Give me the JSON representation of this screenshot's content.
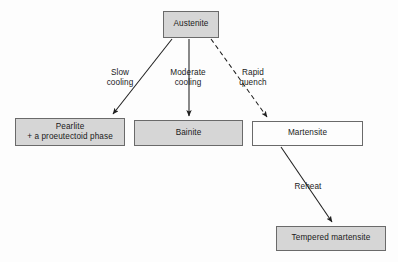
{
  "diagram": {
    "colors": {
      "node_fill_shaded": "#d6d6d6",
      "node_fill_plain": "#fdfdfd",
      "node_stroke": "#6a6a6a",
      "edge_stroke": "#1f1f1f",
      "text": "#1a1a1a",
      "background": "#fdfdfd"
    },
    "nodes": [
      {
        "id": "austenite",
        "lines": [
          "Austenite"
        ],
        "fill": "shaded"
      },
      {
        "id": "pearlite",
        "lines": [
          "Pearlite",
          "+ a proeutectoid phase"
        ],
        "fill": "shaded"
      },
      {
        "id": "bainite",
        "lines": [
          "Bainite"
        ],
        "fill": "shaded"
      },
      {
        "id": "martensite",
        "lines": [
          "Martensite"
        ],
        "fill": "plain"
      },
      {
        "id": "tempered-martensite",
        "lines": [
          "Tempered martensite"
        ],
        "fill": "shaded"
      }
    ],
    "edges": [
      {
        "id": "slow-cooling",
        "from": "austenite",
        "to": "pearlite",
        "style": "solid",
        "label_lines": [
          "Slow",
          "cooling"
        ]
      },
      {
        "id": "moderate-cooling",
        "from": "austenite",
        "to": "bainite",
        "style": "solid",
        "label_lines": [
          "Moderate",
          "cooling"
        ]
      },
      {
        "id": "rapid-quench",
        "from": "austenite",
        "to": "martensite",
        "style": "dashed",
        "label_lines": [
          "Rapid",
          "quench"
        ]
      },
      {
        "id": "reheat",
        "from": "martensite",
        "to": "tempered-martensite",
        "style": "solid",
        "label_lines": [
          "Reheat"
        ]
      }
    ]
  }
}
